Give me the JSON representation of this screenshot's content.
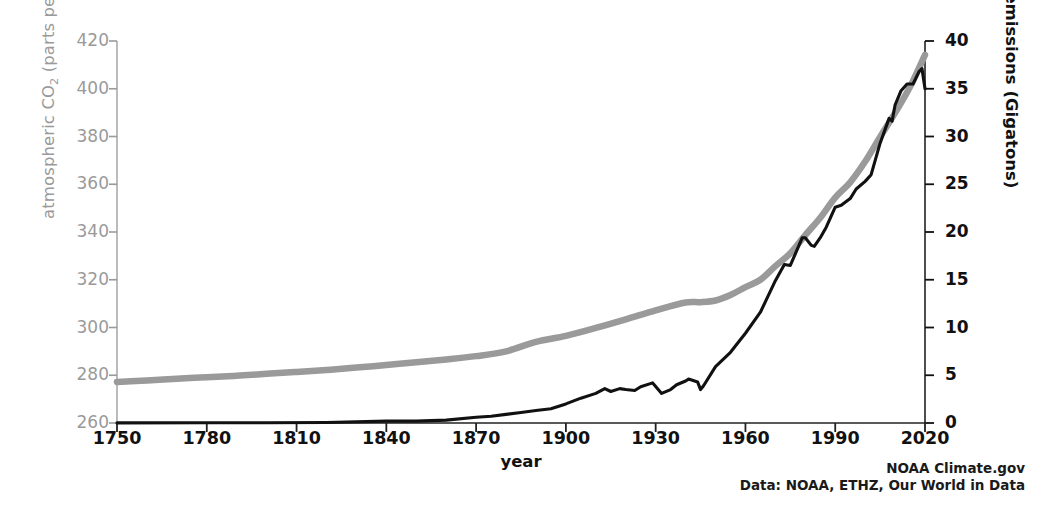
{
  "chart_data": {
    "type": "line",
    "title": "",
    "xlabel": "year",
    "xlim": [
      1750,
      2020
    ],
    "xticks": [
      1750,
      1780,
      1810,
      1840,
      1870,
      1900,
      1930,
      1960,
      1990,
      2020
    ],
    "grid": false,
    "legend": "none",
    "axes": {
      "left": {
        "label": "atmospheric CO2 (parts per million)",
        "label_main": "atmospheric CO",
        "label_sub": "2",
        "label_tail": " (parts per million)",
        "ylim": [
          260,
          420
        ],
        "yticks": [
          260,
          280,
          300,
          320,
          340,
          360,
          380,
          400,
          420
        ],
        "color": "#9a9a9a"
      },
      "right": {
        "label": "CO2 emissions (Gigatons)",
        "label_main": "CO",
        "label_sub": "2",
        "label_tail": " emissions (Gigatons)",
        "ylim": [
          0,
          40
        ],
        "yticks": [
          0,
          5,
          10,
          15,
          20,
          25,
          30,
          35,
          40
        ],
        "color": "#111111"
      }
    },
    "series": [
      {
        "name": "atmospheric CO2",
        "axis": "left",
        "color": "#9a9a9a",
        "units": "parts per million",
        "x": [
          1750,
          1760,
          1770,
          1780,
          1790,
          1800,
          1810,
          1820,
          1830,
          1840,
          1850,
          1860,
          1870,
          1880,
          1890,
          1900,
          1910,
          1920,
          1930,
          1940,
          1945,
          1950,
          1955,
          1960,
          1965,
          1970,
          1975,
          1980,
          1985,
          1990,
          1995,
          2000,
          2005,
          2010,
          2015,
          2020
        ],
        "y": [
          277.2,
          277.8,
          278.5,
          279.2,
          279.8,
          280.6,
          281.4,
          282.2,
          283.2,
          284.3,
          285.4,
          286.6,
          288.0,
          290.0,
          294.0,
          296.5,
          299.8,
          303.4,
          307.2,
          310.5,
          310.6,
          311.3,
          313.6,
          316.9,
          320.0,
          325.7,
          331.1,
          338.7,
          346.0,
          354.4,
          360.8,
          369.5,
          379.8,
          389.9,
          400.8,
          414.2
        ]
      },
      {
        "name": "CO2 emissions",
        "axis": "right",
        "color": "#111111",
        "units": "Gigatons",
        "x": [
          1750,
          1780,
          1800,
          1820,
          1840,
          1850,
          1860,
          1870,
          1875,
          1880,
          1885,
          1890,
          1895,
          1900,
          1905,
          1910,
          1913,
          1915,
          1918,
          1920,
          1923,
          1925,
          1929,
          1932,
          1935,
          1937,
          1940,
          1941,
          1944,
          1945,
          1946,
          1950,
          1955,
          1960,
          1965,
          1970,
          1973,
          1975,
          1979,
          1980,
          1982,
          1983,
          1985,
          1987,
          1990,
          1992,
          1995,
          1997,
          2000,
          2002,
          2005,
          2008,
          2009,
          2010,
          2012,
          2014,
          2016,
          2018,
          2019,
          2020
        ],
        "y": [
          0.01,
          0.02,
          0.03,
          0.05,
          0.2,
          0.2,
          0.3,
          0.6,
          0.7,
          0.9,
          1.1,
          1.3,
          1.5,
          2.0,
          2.6,
          3.1,
          3.6,
          3.3,
          3.6,
          3.5,
          3.4,
          3.8,
          4.2,
          3.1,
          3.5,
          4.0,
          4.4,
          4.6,
          4.3,
          3.5,
          3.9,
          5.9,
          7.4,
          9.4,
          11.6,
          14.9,
          16.6,
          16.5,
          19.4,
          19.4,
          18.6,
          18.5,
          19.4,
          20.5,
          22.6,
          22.8,
          23.5,
          24.5,
          25.3,
          26.0,
          29.3,
          31.9,
          31.6,
          33.3,
          34.8,
          35.5,
          35.5,
          36.8,
          37.1,
          35.0
        ]
      }
    ]
  },
  "credits": {
    "line1": "NOAA Climate.gov",
    "line2": "Data: NOAA, ETHZ, Our World in Data"
  },
  "geometry": {
    "plot_left": 117,
    "plot_right": 925,
    "plot_top": 41,
    "plot_bottom": 423
  }
}
